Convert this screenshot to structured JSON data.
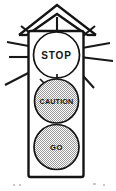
{
  "illustration": {
    "title": "Traffic Signal",
    "description": "Line-art drawing of a three-lamp traffic signal with a peaked roof and radiating burst lines",
    "style": "black and white clip art",
    "background_color": "#ffffff",
    "ink_color": "#141414",
    "lit_fill_color": "#b9b9b9"
  },
  "signal": {
    "lamps": [
      {
        "label": "STOP",
        "position": "top",
        "state": "off",
        "fill": "white"
      },
      {
        "label": "CAUTION",
        "position": "middle",
        "state": "lit",
        "fill": "stipple-gray"
      },
      {
        "label": "GO",
        "position": "bottom",
        "state": "lit",
        "fill": "stipple-gray"
      }
    ],
    "housing": {
      "shape": "rounded-rectangle",
      "roof": "peaked-chevron"
    },
    "burst": {
      "ray_count": 10,
      "origin": "top lamp"
    }
  }
}
